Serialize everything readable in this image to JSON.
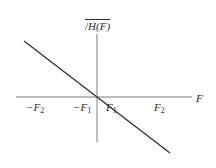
{
  "diagram": {
    "type": "phase-response-plot",
    "y_axis": {
      "label_prefix": "/",
      "label": "H(F)"
    },
    "x_axis": {
      "label": "F"
    },
    "ticks": [
      {
        "sign": "−",
        "base": "F",
        "sub": "2"
      },
      {
        "sign": "−",
        "base": "F",
        "sub": "1"
      },
      {
        "sign": "",
        "base": "F",
        "sub": "1"
      },
      {
        "sign": "",
        "base": "F",
        "sub": "2"
      }
    ],
    "line": {
      "description": "linear phase, negative slope through origin",
      "color": "#2a2a2a"
    },
    "colors": {
      "axis": "#7a7a7a",
      "line": "#2a2a2a",
      "text": "#2a2a2a",
      "background": "#ffffff"
    }
  }
}
